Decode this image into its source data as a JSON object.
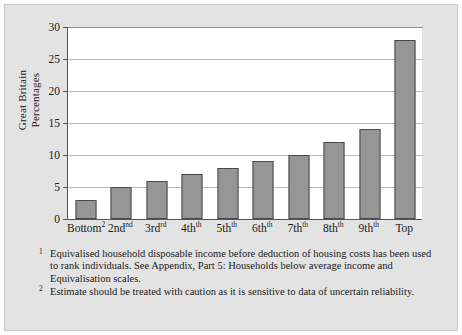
{
  "chart_data": {
    "type": "bar",
    "title": "",
    "xlabel": "",
    "ylabel": "Great Britain Percentages",
    "ylabel_lines": [
      "Great Britain",
      "Percentages"
    ],
    "categories": [
      "Bottom",
      "2nd",
      "3rd",
      "4th",
      "5th",
      "6th",
      "7th",
      "8th",
      "9th",
      "Top"
    ],
    "category_superscripts": [
      "2",
      "",
      "",
      "",
      "",
      "",
      "",
      "",
      "",
      ""
    ],
    "category_ordinal_suffixes": [
      "",
      "nd",
      "rd",
      "th",
      "th",
      "th",
      "th",
      "th",
      "th",
      ""
    ],
    "values": [
      3,
      5,
      6,
      7,
      8,
      9,
      10,
      12,
      14,
      28
    ],
    "ylim": [
      0,
      30
    ],
    "yticks": [
      0,
      5,
      10,
      15,
      20,
      25,
      30
    ],
    "ytick_labels": [
      "0",
      "5",
      "10",
      "15",
      "20",
      "25",
      "30"
    ],
    "grid": true,
    "legend": "none",
    "bar_color": "#969696",
    "bar_border_color": "#4a4a4a",
    "plot_background": "#ffffff",
    "panel_background": "#e3e3e3",
    "gridline_color": "#b9b9b9"
  },
  "footnotes": [
    {
      "marker": "1",
      "text": "Equivalised household disposable income before deduction of housing costs has been used to rank individuals. See Appendix, Part 5: Households below average income  and Equivalisation scales."
    },
    {
      "marker": "2",
      "text": "Estimate should be treated with caution as it is sensitive to data of uncertain reliability."
    }
  ]
}
